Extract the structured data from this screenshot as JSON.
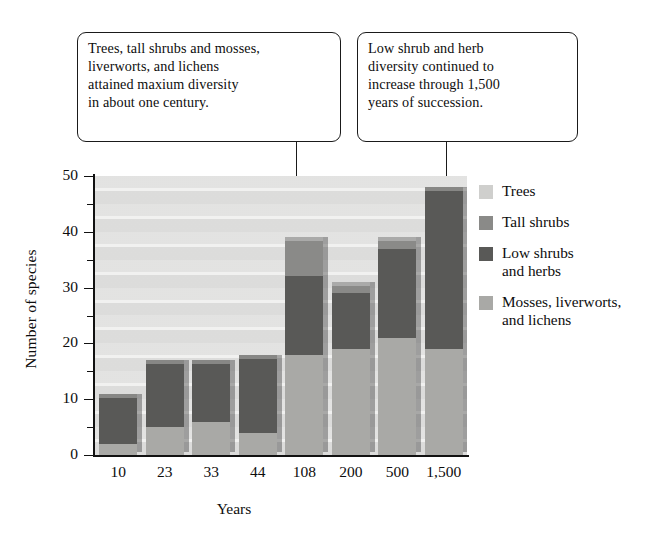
{
  "callouts": [
    {
      "id": "left",
      "text": "Trees, tall shrubs and mosses,\nliverworts, and lichens\nattained maxium diversity\nin about one century."
    },
    {
      "id": "right",
      "text": "Low shrub and herb\ndiversity continued to\nincrease through 1,500\nyears of succession."
    }
  ],
  "legend": {
    "items": [
      {
        "label": "Trees",
        "color": "#cfcfcd"
      },
      {
        "label": "Tall shrubs",
        "color": "#8a8a88"
      },
      {
        "label": "Low shrubs\nand herbs",
        "color": "#595957"
      },
      {
        "label": "Mosses, liverworts,\nand lichens",
        "color": "#a9a9a6"
      }
    ]
  },
  "chart_data": {
    "type": "bar",
    "subtype": "stacked-vertical-3d",
    "title": "",
    "xlabel": "Years",
    "ylabel": "Number of species",
    "ylim": [
      0,
      50
    ],
    "y_major_ticks": [
      0,
      10,
      20,
      30,
      40,
      50
    ],
    "y_minor_ticks": [
      5,
      15,
      25,
      35,
      45
    ],
    "y_tick_labels": [
      "0",
      "10",
      "20",
      "30",
      "40",
      "50"
    ],
    "grid": "horizontal-bands",
    "legend_position": "right",
    "categories": [
      "10",
      "23",
      "33",
      "44",
      "108",
      "200",
      "500",
      "1,500"
    ],
    "stack_order_bottom_to_top": [
      "Mosses, liverworts, and lichens",
      "Low shrubs and herbs",
      "Tall shrubs",
      "Trees"
    ],
    "series": [
      {
        "name": "Mosses, liverworts, and lichens",
        "color": "#a9a9a6",
        "values": [
          2,
          5,
          6,
          4,
          18,
          19,
          21,
          19
        ]
      },
      {
        "name": "Low shrubs and herbs",
        "color": "#595957",
        "values": [
          9,
          12,
          11,
          14,
          14,
          10,
          16,
          29
        ]
      },
      {
        "name": "Tall shrubs",
        "color": "#8a8a88",
        "values": [
          0,
          0,
          0,
          0,
          7,
          2,
          2,
          0
        ]
      },
      {
        "name": "Trees",
        "color": "#cfcfcd",
        "values": [
          0,
          0,
          0,
          0,
          0,
          0,
          0,
          0
        ]
      }
    ],
    "totals": [
      11,
      17,
      17,
      18,
      39,
      31,
      39,
      48
    ],
    "annotations": [
      "Trees, tall shrubs and mosses, liverworts, and lichens attained maxium diversity in about one century.",
      "Low shrub and herb diversity continued to increase through 1,500 years of succession."
    ]
  }
}
